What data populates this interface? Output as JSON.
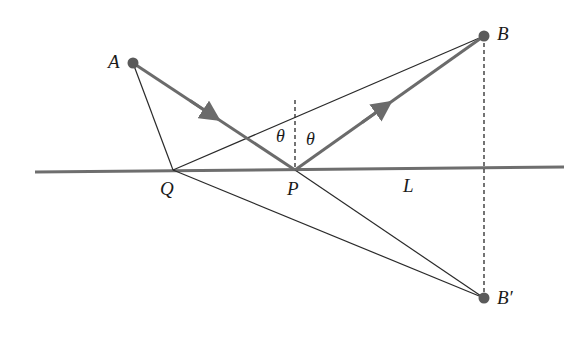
{
  "diagram": {
    "colors": {
      "ray": "#6b6b6b",
      "thin_line": "#2a2a2a",
      "mirror_line": "#6e6e6e",
      "point": "#5a5a5a",
      "text": "#1a1a1a"
    },
    "points": {
      "A": {
        "label": "A",
        "x": 133,
        "y": 63
      },
      "B": {
        "label": "B",
        "x": 484,
        "y": 36
      },
      "B_prime": {
        "label": "B′",
        "x": 484,
        "y": 298
      },
      "P": {
        "label": "P",
        "x": 295,
        "y": 170
      },
      "Q": {
        "label": "Q",
        "x": 173,
        "y": 170
      }
    },
    "line_label": "L",
    "angle_labels": {
      "incident": "θ",
      "reflected": "θ"
    }
  }
}
